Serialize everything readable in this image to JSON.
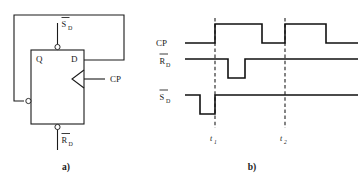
{
  "figure": {
    "panels": [
      {
        "id": "a",
        "caption": "a)",
        "description": "D flip-flop logic symbol with feedback"
      },
      {
        "id": "b",
        "caption": "b)",
        "description": "Timing waveform diagram"
      }
    ]
  },
  "circuit": {
    "caption": "a)",
    "block_labels": {
      "q_output": "Q",
      "d_input": "D"
    },
    "pin_labels": {
      "clock": "CP",
      "set_bar_base": "S",
      "set_bar_sub": "D",
      "reset_bar_base": "R",
      "reset_bar_sub": "D"
    },
    "notes": {
      "set_pin_name": "S̅D (active-low set, top)",
      "reset_pin_name": "R̅D (active-low reset, bottom)",
      "qbar_pin_name": "Q̅ (inverted output, left side)",
      "clock_pin_name": "CP (edge-triggered clock, right side)"
    }
  },
  "timing": {
    "caption": "b)",
    "signals": [
      {
        "name": "CP",
        "overbar": false,
        "base": "CP",
        "subscript": ""
      },
      {
        "name": "R̅D",
        "overbar": true,
        "base": "R",
        "subscript": "D"
      },
      {
        "name": "S̅D",
        "overbar": true,
        "base": "S",
        "subscript": "D"
      }
    ],
    "markers": [
      {
        "base": "t",
        "subscript": "1"
      },
      {
        "base": "t",
        "subscript": "2"
      }
    ]
  },
  "colors": {
    "ink": "#1a1a1a",
    "wave": "#111111",
    "dashed_marker": "#333333",
    "background": "#ffffff"
  },
  "chart_data": {
    "type": "line",
    "xlabel": "",
    "ylabel": "",
    "grid": false,
    "legend_position": "left-axis-labels",
    "xlim": [
      185,
      358
    ],
    "series": [
      {
        "name": "CP",
        "level_low_y": 43,
        "level_high_y": 24,
        "points": [
          [
            185,
            43
          ],
          [
            215,
            43
          ],
          [
            215,
            24
          ],
          [
            262,
            24
          ],
          [
            262,
            43
          ],
          [
            285,
            43
          ],
          [
            285,
            24
          ],
          [
            326,
            24
          ],
          [
            326,
            43
          ],
          [
            358,
            43
          ]
        ]
      },
      {
        "name": "R̅D",
        "level_low_y": 78,
        "level_high_y": 59,
        "points": [
          [
            185,
            59
          ],
          [
            228,
            59
          ],
          [
            228,
            78
          ],
          [
            245,
            78
          ],
          [
            245,
            59
          ],
          [
            358,
            59
          ]
        ]
      },
      {
        "name": "S̅D",
        "level_low_y": 114,
        "level_high_y": 95,
        "points": [
          [
            185,
            95
          ],
          [
            200,
            95
          ],
          [
            200,
            114
          ],
          [
            215,
            114
          ],
          [
            215,
            95
          ],
          [
            358,
            95
          ]
        ]
      }
    ],
    "markers": [
      {
        "label": "t1",
        "x": 215,
        "y_top": 18,
        "y_bottom": 128,
        "style": "dashed"
      },
      {
        "label": "t2",
        "x": 285,
        "y_top": 18,
        "y_bottom": 128,
        "style": "dashed"
      }
    ],
    "annotations": [
      {
        "text": "t₁",
        "x": 211,
        "y": 140
      },
      {
        "text": "t₂",
        "x": 281,
        "y": 140
      }
    ]
  }
}
